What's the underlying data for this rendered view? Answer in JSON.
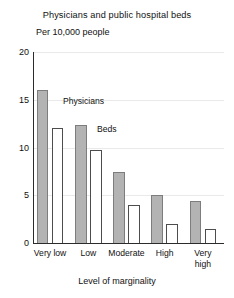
{
  "chart_data": {
    "type": "bar",
    "title": "Physicians and public hospital beds",
    "subtitle": "Per 10,000 people",
    "xlabel": "Level of marginality",
    "ylabel": "",
    "ylim": [
      0,
      20
    ],
    "yticks": [
      0,
      5,
      10,
      15,
      20
    ],
    "ytick_labels": [
      "0",
      "5",
      "10",
      "15",
      "20"
    ],
    "grid": false,
    "legend_position": "in-plot-annotations",
    "categories": [
      "Very low",
      "Low",
      "Moderate",
      "High",
      "Very high"
    ],
    "category_labels": [
      "Very low",
      "Low",
      "Moderate",
      "High",
      "Very\nhigh"
    ],
    "series": [
      {
        "name": "Physicians",
        "color": "#b3b3b3",
        "values": [
          16.0,
          12.4,
          7.4,
          5.0,
          4.4
        ]
      },
      {
        "name": "Beds",
        "color": "#ffffff",
        "values": [
          12.0,
          9.7,
          4.0,
          2.0,
          1.5
        ]
      }
    ],
    "annotations": [
      {
        "text": "Physicians",
        "x_px": 63,
        "y_px": 96
      },
      {
        "text": "Beds",
        "x_px": 97,
        "y_px": 124
      }
    ]
  }
}
